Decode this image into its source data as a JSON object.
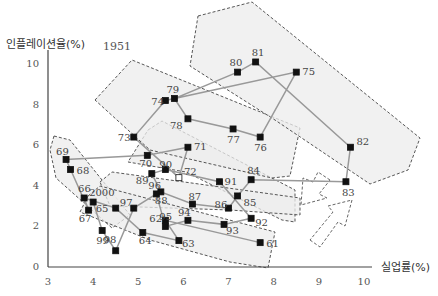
{
  "chart_data": {
    "type": "scatter",
    "title": "",
    "xlabel": "실업률(%)",
    "ylabel": "인플레이션율(%)",
    "xlim": [
      3,
      10
    ],
    "ylim": [
      0,
      10
    ],
    "xticks": [
      "3",
      "4",
      "5",
      "6",
      "7",
      "8",
      "9",
      "10"
    ],
    "yticks": [
      "0",
      "2",
      "4",
      "6",
      "8",
      "10"
    ],
    "annotation_year": "1951",
    "grid": false,
    "connected_path": true,
    "points": [
      {
        "label": "61",
        "x": 7.7,
        "y": 1.2
      },
      {
        "label": "62",
        "x": 5.6,
        "y": 2.3
      },
      {
        "label": "63",
        "x": 5.9,
        "y": 1.3
      },
      {
        "label": "64",
        "x": 5.1,
        "y": 1.7
      },
      {
        "label": "65",
        "x": 4.5,
        "y": 2.9
      },
      {
        "label": "66",
        "x": 3.8,
        "y": 3.4
      },
      {
        "label": "67",
        "x": 3.9,
        "y": 2.8
      },
      {
        "label": "68",
        "x": 3.5,
        "y": 4.8
      },
      {
        "label": "69",
        "x": 3.4,
        "y": 5.3
      },
      {
        "label": "70",
        "x": 5.2,
        "y": 5.5
      },
      {
        "label": "71",
        "x": 6.1,
        "y": 5.9
      },
      {
        "label": "72",
        "x": 5.9,
        "y": 4.4,
        "hollow": true
      },
      {
        "label": "73",
        "x": 4.9,
        "y": 6.4
      },
      {
        "label": "74",
        "x": 5.6,
        "y": 8.2
      },
      {
        "label": "75",
        "x": 8.5,
        "y": 9.6
      },
      {
        "label": "76",
        "x": 7.7,
        "y": 6.4
      },
      {
        "label": "77",
        "x": 7.1,
        "y": 6.8
      },
      {
        "label": "78",
        "x": 6.1,
        "y": 7.3
      },
      {
        "label": "79",
        "x": 5.8,
        "y": 8.3
      },
      {
        "label": "80",
        "x": 7.2,
        "y": 9.6
      },
      {
        "label": "81",
        "x": 7.6,
        "y": 10.1
      },
      {
        "label": "82",
        "x": 9.7,
        "y": 5.9
      },
      {
        "label": "83",
        "x": 9.6,
        "y": 4.2
      },
      {
        "label": "84",
        "x": 7.5,
        "y": 4.3
      },
      {
        "label": "85",
        "x": 7.2,
        "y": 3.5
      },
      {
        "label": "86",
        "x": 7.0,
        "y": 2.9
      },
      {
        "label": "87",
        "x": 6.2,
        "y": 3.1
      },
      {
        "label": "88",
        "x": 5.5,
        "y": 3.7
      },
      {
        "label": "89",
        "x": 5.3,
        "y": 4.6
      },
      {
        "label": "90",
        "x": 5.6,
        "y": 4.8
      },
      {
        "label": "91",
        "x": 6.8,
        "y": 4.2
      },
      {
        "label": "92",
        "x": 7.5,
        "y": 2.4
      },
      {
        "label": "93",
        "x": 6.9,
        "y": 2.1
      },
      {
        "label": "94",
        "x": 6.1,
        "y": 2.3
      },
      {
        "label": "95",
        "x": 5.6,
        "y": 2.0
      },
      {
        "label": "96",
        "x": 5.4,
        "y": 3.6
      },
      {
        "label": "97",
        "x": 4.9,
        "y": 2.9
      },
      {
        "label": "98",
        "x": 4.5,
        "y": 0.8
      },
      {
        "label": "99",
        "x": 4.2,
        "y": 1.8
      },
      {
        "label": "2000",
        "x": 4.0,
        "y": 3.2
      }
    ],
    "path_order": [
      "61",
      "62",
      "63",
      "64",
      "65",
      "66",
      "67",
      "68",
      "69",
      "70",
      "71",
      "72",
      "73",
      "74",
      "75",
      "76",
      "77",
      "78",
      "79",
      "80",
      "81",
      "82",
      "83",
      "84",
      "85",
      "86",
      "87",
      "88",
      "89",
      "90",
      "91",
      "92",
      "93",
      "94",
      "95",
      "96",
      "97",
      "98",
      "99",
      "2000"
    ],
    "shaded_regions": [
      "1960s band (lower left)",
      "1970s band (middle)",
      "late-1970s/early-1980s band (upper right)",
      "1980s–1990s band (center)",
      "1990s–2000 band (lower)"
    ],
    "arrows": [
      "dashed arrow pointing down-left",
      "dashed arrow pointing up-right"
    ]
  }
}
